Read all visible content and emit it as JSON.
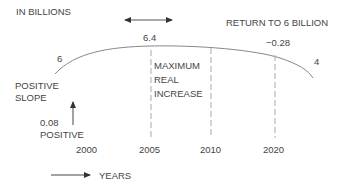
{
  "diagram": {
    "unit_label": "IN BILLIONS",
    "return_label": "RETURN TO 6 BILLION",
    "start_value": "6",
    "peak_value": "6.4",
    "end_value": "4",
    "slope_end": "−0.28",
    "positive_slope_label": [
      "POSITIVE",
      "SLOPE"
    ],
    "slope_start": [
      "0.08",
      "POSITIVE"
    ],
    "max_increase_label": [
      "MAXIMUM",
      "REAL",
      "INCREASE"
    ],
    "years": [
      "2000",
      "2005",
      "2010",
      "2020"
    ],
    "axis_label": "YEARS",
    "colors": {
      "line": "#888888",
      "text": "#444444",
      "dashed": "#aaaaaa"
    }
  }
}
